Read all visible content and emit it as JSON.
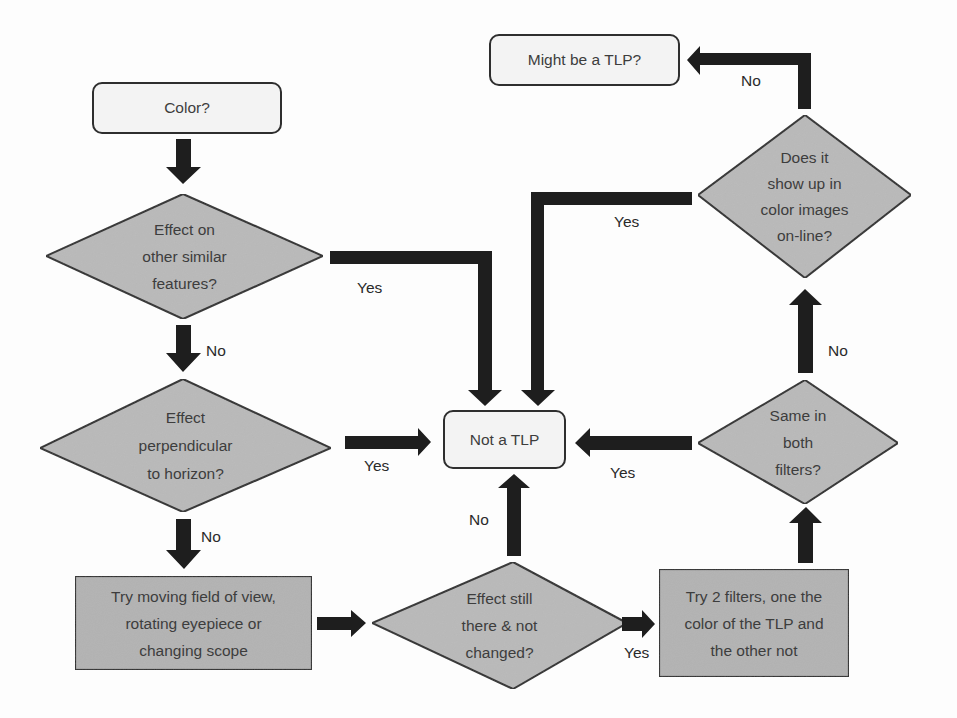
{
  "colors": {
    "background": "#fdfdfd",
    "start_fill": "#f3f3f3",
    "decision_fill": "#b9b9b9",
    "process_fill": "#b3b3b3",
    "outline": "#2e2e2e",
    "arrow": "#1e1e1e",
    "text": "#3d3d3d"
  },
  "nodes": {
    "color": {
      "type": "terminal",
      "lines": [
        "Color?"
      ]
    },
    "effect_similar": {
      "type": "decision",
      "lines": [
        "Effect on",
        "other similar",
        "features?"
      ]
    },
    "effect_perpendicular": {
      "type": "decision",
      "lines": [
        "Effect",
        "perpendicular",
        "to horizon?"
      ]
    },
    "try_moving": {
      "type": "process",
      "lines": [
        "Try moving field of view,",
        "rotating eyepiece or",
        "changing scope"
      ]
    },
    "effect_still": {
      "type": "decision",
      "lines": [
        "Effect still",
        "there & not",
        "changed?"
      ]
    },
    "not_tlp": {
      "type": "terminal",
      "lines": [
        "Not a TLP"
      ]
    },
    "try_filters": {
      "type": "process",
      "lines": [
        "Try 2 filters, one the",
        "color of the TLP and",
        "the other not"
      ]
    },
    "same_filters": {
      "type": "decision",
      "lines": [
        "Same in",
        "both",
        "filters?"
      ]
    },
    "show_online": {
      "type": "decision",
      "lines": [
        "Does it",
        "show up in",
        "color images",
        "on-line?"
      ]
    },
    "might_be": {
      "type": "terminal",
      "lines": [
        "Might be a TLP?"
      ]
    }
  },
  "edges": [
    {
      "from": "color",
      "to": "effect_similar",
      "label": ""
    },
    {
      "from": "effect_similar",
      "to": "not_tlp",
      "label": "Yes"
    },
    {
      "from": "effect_similar",
      "to": "effect_perpendicular",
      "label": "No"
    },
    {
      "from": "effect_perpendicular",
      "to": "not_tlp",
      "label": "Yes"
    },
    {
      "from": "effect_perpendicular",
      "to": "try_moving",
      "label": "No"
    },
    {
      "from": "try_moving",
      "to": "effect_still",
      "label": ""
    },
    {
      "from": "effect_still",
      "to": "not_tlp",
      "label": "No"
    },
    {
      "from": "effect_still",
      "to": "try_filters",
      "label": "Yes"
    },
    {
      "from": "try_filters",
      "to": "same_filters",
      "label": ""
    },
    {
      "from": "same_filters",
      "to": "not_tlp",
      "label": "Yes"
    },
    {
      "from": "same_filters",
      "to": "show_online",
      "label": "No"
    },
    {
      "from": "show_online",
      "to": "not_tlp",
      "label": "Yes"
    },
    {
      "from": "show_online",
      "to": "might_be",
      "label": "No"
    }
  ]
}
